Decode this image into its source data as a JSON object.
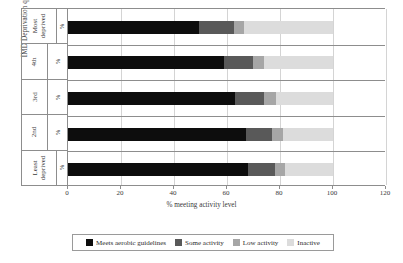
{
  "chart_data": {
    "type": "bar",
    "orientation": "horizontal",
    "stacked": true,
    "title": "",
    "xlabel": "% meeting activity level",
    "ylabel": "IMD Deprivation quintile",
    "categories": [
      "Most deprived",
      "4th",
      "3rd",
      "2nd",
      "Least deprived"
    ],
    "category_sublabel": "%",
    "series": [
      {
        "name": "Meets aerobic guidelines",
        "color": "#0d0d0d",
        "values": [
          49.5,
          59,
          63,
          67,
          68
        ]
      },
      {
        "name": "Some activity",
        "color": "#595959",
        "values": [
          13,
          11,
          11,
          10,
          10
        ]
      },
      {
        "name": "Low activity",
        "color": "#a6a6a6",
        "values": [
          4,
          4,
          4.5,
          4,
          4
        ]
      },
      {
        "name": "Inactive",
        "color": "#dcdcdc",
        "values": [
          33.5,
          26,
          21.5,
          19,
          18
        ]
      }
    ],
    "xlim": [
      0,
      120
    ],
    "xticks": [
      0,
      20,
      40,
      60,
      80,
      100,
      120
    ],
    "xtick_labels": [
      "0",
      "20",
      "40",
      "60",
      "80",
      "100",
      "120"
    ],
    "grid": true,
    "legend_position": "bottom"
  },
  "legend": {
    "items": [
      {
        "label": "Meets aerobic guidelines",
        "swatch": "s0"
      },
      {
        "label": "Some activity",
        "swatch": "s1"
      },
      {
        "label": "Low activity",
        "swatch": "s2"
      },
      {
        "label": "Inactive",
        "swatch": "s3"
      }
    ]
  }
}
